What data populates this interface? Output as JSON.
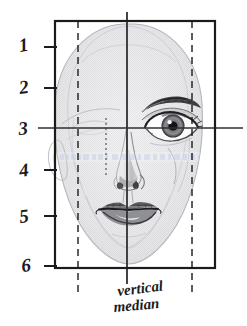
{
  "diagram": {
    "caption": {
      "line1": "vertical",
      "line2": "median"
    },
    "watermark": "www.faint-watermark-text.com",
    "frame": {
      "left": 55,
      "top": 21,
      "right": 215,
      "bottom": 268,
      "stroke": "#1b1b1b",
      "stroke_width": 2.2
    },
    "row_labels": [
      {
        "text": "1",
        "value": 1,
        "y": 47,
        "tick": true
      },
      {
        "text": "2",
        "value": 2,
        "y": 88,
        "tick": true
      },
      {
        "text": "3",
        "value": 3,
        "y": 128,
        "tick": false
      },
      {
        "text": "4",
        "value": 4,
        "y": 170,
        "tick": true
      },
      {
        "text": "5",
        "value": 5,
        "y": 216,
        "tick": true
      },
      {
        "text": "6",
        "value": 6,
        "y": 266,
        "tick": false
      }
    ],
    "guides": {
      "vertical_median": {
        "x": 127,
        "y_top": 12,
        "y_bottom": 284,
        "style": "solid",
        "color": "#333333"
      },
      "eye_level": {
        "y": 128,
        "x_left": 38,
        "x_right": 243,
        "style": "solid",
        "color": "#333333",
        "label": "3"
      },
      "dashed_verticals": [
        {
          "x": 78,
          "y_top": 21,
          "y_bottom": 296,
          "style": "dashed"
        },
        {
          "x": 192,
          "y_top": 21,
          "y_bottom": 296,
          "style": "dashed"
        }
      ],
      "dotted_vertical": {
        "x": 106,
        "y_top": 118,
        "y_bottom": 175,
        "style": "dotted"
      }
    },
    "colors": {
      "ink": "#1b1b1b",
      "guide": "#333333",
      "face_fill": "#e9e9ea",
      "face_outline": "#b9bcc4",
      "watermark": "#c9d4e8",
      "paper": "#ffffff"
    },
    "features": [
      {
        "name": "head-silhouette",
        "shaded": true
      },
      {
        "name": "right-eye",
        "detail": "fully rendered with iris, lashes, eyebrow"
      },
      {
        "name": "left-eye",
        "detail": "faint construction outline only"
      },
      {
        "name": "nose",
        "detail": "shaded tip and nostril"
      },
      {
        "name": "mouth",
        "detail": "fully rendered lips"
      },
      {
        "name": "ear-left",
        "detail": "faint outline"
      }
    ]
  }
}
